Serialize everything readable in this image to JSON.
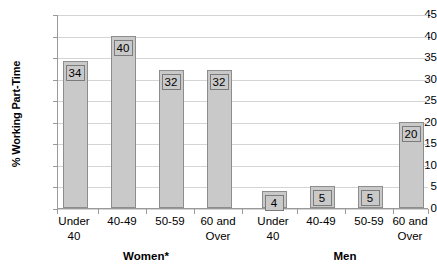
{
  "chart_data": {
    "type": "bar",
    "title": "",
    "xlabel": "",
    "ylabel": "% Working Part-Time",
    "ylim": [
      0,
      45
    ],
    "ytick_step": 5,
    "yticks": [
      45,
      40,
      35,
      30,
      25,
      20,
      15,
      10,
      5,
      0
    ],
    "grid": true,
    "legend": "none",
    "groups": [
      {
        "name": "Women*",
        "categories": [
          "Under 40",
          "40-49",
          "50-59",
          "60 and Over"
        ],
        "values": [
          34,
          40,
          32,
          32
        ]
      },
      {
        "name": "Men",
        "categories": [
          "Under 40",
          "40-49",
          "50-59",
          "60 and Over"
        ],
        "values": [
          4,
          5,
          5,
          20
        ]
      }
    ],
    "categories": [
      "Under 40",
      "40-49",
      "50-59",
      "60 and Over",
      "Under 40",
      "40-49",
      "50-59",
      "60 and Over"
    ],
    "values": [
      34,
      40,
      32,
      32,
      4,
      5,
      5,
      20
    ],
    "data_labels": [
      "34",
      "40",
      "32",
      "32",
      "4",
      "5",
      "5",
      "20"
    ],
    "colors": {
      "bar_fill": "#c9c9c9",
      "bar_border": "#8d8d8d",
      "gridline": "#d4d4d4",
      "axis": "#9a9a9a",
      "text": "#000000",
      "background": "#ffffff"
    }
  },
  "axis": {
    "y_title": "% Working Part-Time",
    "y_labels": [
      "45",
      "40",
      "35",
      "30",
      "25",
      "20",
      "15",
      "10",
      "5",
      "0"
    ]
  },
  "x_labels": [
    {
      "line1": "Under",
      "line2": "40"
    },
    {
      "line1": "40-49",
      "line2": ""
    },
    {
      "line1": "50-59",
      "line2": ""
    },
    {
      "line1": "60 and",
      "line2": "Over"
    },
    {
      "line1": "Under",
      "line2": "40"
    },
    {
      "line1": "40-49",
      "line2": ""
    },
    {
      "line1": "50-59",
      "line2": ""
    },
    {
      "line1": "60 and",
      "line2": "Over"
    }
  ],
  "group_labels": [
    {
      "text": "Women*"
    },
    {
      "text": "Men"
    }
  ]
}
